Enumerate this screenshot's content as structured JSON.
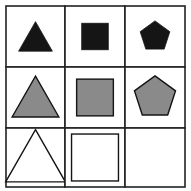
{
  "grid": {
    "rows": 3,
    "cols": 3
  },
  "colors": {
    "line": "#222222",
    "black": "#151515",
    "gray": "#8a8a8a",
    "white": "#ffffff"
  },
  "cells": [
    {
      "row": 0,
      "col": 0,
      "shape": "triangle",
      "fill": "black",
      "size": "small"
    },
    {
      "row": 0,
      "col": 1,
      "shape": "square",
      "fill": "black",
      "size": "small"
    },
    {
      "row": 0,
      "col": 2,
      "shape": "pentagon",
      "fill": "black",
      "size": "small"
    },
    {
      "row": 1,
      "col": 0,
      "shape": "triangle",
      "fill": "gray",
      "size": "medium"
    },
    {
      "row": 1,
      "col": 1,
      "shape": "square",
      "fill": "gray",
      "size": "medium"
    },
    {
      "row": 1,
      "col": 2,
      "shape": "pentagon",
      "fill": "gray",
      "size": "medium"
    },
    {
      "row": 2,
      "col": 0,
      "shape": "triangle",
      "fill": "white",
      "size": "large"
    },
    {
      "row": 2,
      "col": 1,
      "shape": "square",
      "fill": "white",
      "size": "large"
    },
    {
      "row": 2,
      "col": 2,
      "shape": "empty",
      "fill": "none",
      "size": "none"
    }
  ]
}
